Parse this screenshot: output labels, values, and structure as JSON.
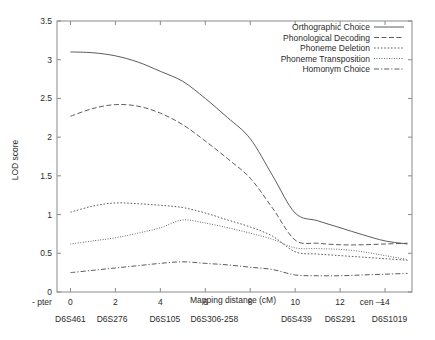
{
  "chart_data": {
    "type": "line",
    "title": "",
    "xlabel": "Mapping distance (cM)",
    "ylabel": "LOD score",
    "xlim": [
      -0.6,
      15.2
    ],
    "ylim": [
      0,
      3.5
    ],
    "xticks": [
      0,
      2,
      4,
      6,
      8,
      10,
      12,
      14
    ],
    "yticks": [
      0,
      0.5,
      1,
      1.5,
      2,
      2.5,
      3,
      3.5
    ],
    "grid": false,
    "legend_position": "top-right",
    "x": [
      0,
      1,
      2,
      3,
      4,
      5,
      6,
      7,
      8,
      9,
      10,
      11,
      12,
      13,
      14,
      15
    ],
    "series": [
      {
        "name": "Orthographic Choice",
        "dash": "solid",
        "values": [
          3.1,
          3.09,
          3.05,
          2.97,
          2.85,
          2.72,
          2.5,
          2.25,
          1.98,
          1.5,
          1.02,
          0.92,
          0.83,
          0.74,
          0.66,
          0.62
        ]
      },
      {
        "name": "Phonological Decoding",
        "dash": "dashed",
        "values": [
          2.27,
          2.37,
          2.42,
          2.4,
          2.31,
          2.16,
          1.95,
          1.72,
          1.47,
          1.08,
          0.67,
          0.63,
          0.61,
          0.61,
          0.62,
          0.63
        ]
      },
      {
        "name": "Phoneme Deletion",
        "dash": "dotted",
        "values": [
          1.03,
          1.11,
          1.15,
          1.14,
          1.12,
          1.09,
          1.02,
          0.93,
          0.84,
          0.72,
          0.52,
          0.49,
          0.47,
          0.45,
          0.43,
          0.41
        ]
      },
      {
        "name": "Phoneme Transposition",
        "dash": "fine-dotted",
        "values": [
          0.62,
          0.66,
          0.7,
          0.76,
          0.83,
          0.93,
          0.89,
          0.83,
          0.76,
          0.68,
          0.57,
          0.56,
          0.55,
          0.52,
          0.47,
          0.42
        ]
      },
      {
        "name": "Homonym Choice",
        "dash": "dash-dot",
        "values": [
          0.25,
          0.28,
          0.31,
          0.34,
          0.37,
          0.39,
          0.37,
          0.35,
          0.32,
          0.29,
          0.22,
          0.21,
          0.21,
          0.22,
          0.23,
          0.24
        ]
      }
    ],
    "annotations": [
      {
        "text": "- pter",
        "x_px": 42,
        "y_px": 305
      },
      {
        "text": "cen —",
        "x_px": 372,
        "y_px": 305
      }
    ],
    "markers": [
      {
        "label": "D6S461",
        "x": 0.0
      },
      {
        "label": "D6S276",
        "x": 1.85
      },
      {
        "label": "D6S105",
        "x": 4.2
      },
      {
        "label": "D6S306-258",
        "x": 6.4
      },
      {
        "label": "D6S439",
        "x": 10.05
      },
      {
        "label": "D6S291",
        "x": 12.0
      },
      {
        "label": "D6S1019",
        "x": 14.2
      }
    ]
  }
}
